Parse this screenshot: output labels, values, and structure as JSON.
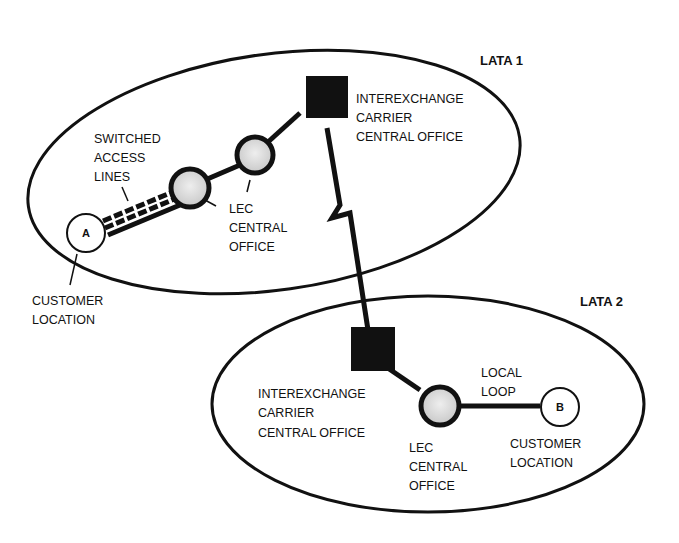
{
  "diagram": {
    "regions": [
      {
        "id": "lata1",
        "label": "LATA 1"
      },
      {
        "id": "lata2",
        "label": "LATA 2"
      }
    ],
    "nodes": {
      "customer_a": {
        "letter": "A",
        "label": [
          "CUSTOMER",
          "LOCATION"
        ]
      },
      "lec1_access": {
        "label": [
          "LEC",
          "CENTRAL",
          "OFFICE"
        ]
      },
      "ixc1": {
        "label": [
          "INTEREXCHANGE",
          "CARRIER",
          "CENTRAL OFFICE"
        ]
      },
      "ixc2": {
        "label": [
          "INTEREXCHANGE",
          "CARRIER",
          "CENTRAL OFFICE"
        ]
      },
      "lec2": {
        "label": [
          "LEC",
          "CENTRAL",
          "OFFICE"
        ]
      },
      "customer_b": {
        "letter": "B",
        "label": [
          "CUSTOMER",
          "LOCATION"
        ]
      }
    },
    "links": {
      "switched_access": {
        "label": [
          "SWITCHED",
          "ACCESS",
          "LINES"
        ]
      },
      "local_loop": {
        "label": [
          "LOCAL",
          "LOOP"
        ]
      }
    },
    "colors": {
      "ink": "#111111",
      "office_fill": "#d8d8d8"
    }
  }
}
